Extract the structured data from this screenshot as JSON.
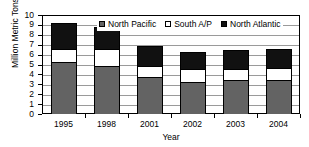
{
  "chart_data": {
    "type": "bar",
    "stacked": true,
    "title": "",
    "xlabel": "Year",
    "ylabel": "Million Metric Tons",
    "categories": [
      "1995",
      "1998",
      "2001",
      "2002",
      "2003",
      "2004"
    ],
    "ylim": [
      0,
      10
    ],
    "yticks": [
      0,
      1,
      2,
      3,
      4,
      5,
      6,
      7,
      8,
      9,
      10
    ],
    "ytick_labels": [
      "0",
      "1",
      "2",
      "3",
      "4",
      "5",
      "6",
      "7",
      "8",
      "9",
      "10"
    ],
    "grid": true,
    "legend_position": "top-center-inside",
    "series": [
      {
        "name": "North Pacific",
        "color": "#636363",
        "values": [
          5.25,
          4.85,
          3.7,
          3.25,
          3.4,
          3.45
        ]
      },
      {
        "name": "South A/P",
        "color": "#ffffff",
        "values": [
          1.35,
          1.7,
          1.15,
          1.25,
          1.15,
          1.2
        ]
      },
      {
        "name": "North Atlantic",
        "color": "#111111",
        "values": [
          2.6,
          2.2,
          2.0,
          1.8,
          1.9,
          1.9
        ]
      }
    ],
    "totals": [
      9.2,
      8.75,
      6.85,
      6.3,
      6.45,
      6.55
    ]
  }
}
